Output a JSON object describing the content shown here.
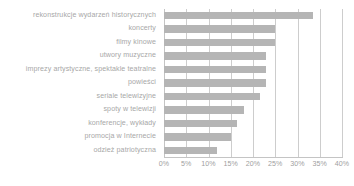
{
  "chart_data": {
    "type": "bar",
    "orientation": "horizontal",
    "title": "",
    "xlabel": "",
    "ylabel": "",
    "categories": [
      "rekonstrukcje wydarzeń historycznych",
      "koncerty",
      "filmy kinowe",
      "utwory muzyczne",
      "imprezy artystyczne, spektakle teatralne",
      "powieści",
      "seriale telewizyjne",
      "spoty w telewizji",
      "konferencje, wykłady",
      "promocja w Internecie",
      "odzież patriotyczna"
    ],
    "values": [
      33.5,
      25,
      25,
      23,
      23,
      23,
      21.5,
      18,
      16.5,
      15,
      12
    ],
    "xlim": [
      0,
      40
    ],
    "tick_values": [
      0,
      5,
      10,
      15,
      20,
      25,
      30,
      35,
      40
    ],
    "tick_labels": [
      "0%",
      "5%",
      "10%",
      "15%",
      "20%",
      "25%",
      "30%",
      "35%",
      "40%"
    ],
    "grid": true,
    "grid_axis": "x",
    "legend": false,
    "bar_color": "#b5b5b5",
    "grid_color": "#cdcdcd",
    "text_color": "#a7a7a7"
  }
}
